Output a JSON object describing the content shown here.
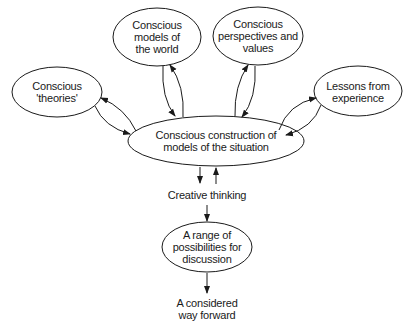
{
  "diagram": {
    "nodes": [
      {
        "id": "theories",
        "lines": [
          "Conscious",
          "'theories'"
        ]
      },
      {
        "id": "models-world",
        "lines": [
          "Conscious",
          "models of",
          "the world"
        ]
      },
      {
        "id": "perspectives",
        "lines": [
          "Conscious",
          "perspectives and",
          "values"
        ]
      },
      {
        "id": "lessons",
        "lines": [
          "Lessons from",
          "experience"
        ]
      },
      {
        "id": "central",
        "lines": [
          "Conscious construction of",
          "models of the situation"
        ]
      },
      {
        "id": "creative",
        "lines": [
          "Creative thinking"
        ]
      },
      {
        "id": "possibilities",
        "lines": [
          "A range of",
          "possibilities for",
          "discussion"
        ]
      },
      {
        "id": "forward",
        "lines": [
          "A considered",
          "way forward"
        ]
      }
    ],
    "edges": [
      {
        "from": "theories",
        "to": "central",
        "bidirectional": true
      },
      {
        "from": "models-world",
        "to": "central",
        "bidirectional": true
      },
      {
        "from": "perspectives",
        "to": "central",
        "bidirectional": true
      },
      {
        "from": "lessons",
        "to": "central",
        "bidirectional": true
      },
      {
        "from": "central",
        "to": "creative",
        "bidirectional": true
      },
      {
        "from": "creative",
        "to": "possibilities",
        "bidirectional": false
      },
      {
        "from": "possibilities",
        "to": "forward",
        "bidirectional": false
      }
    ],
    "colors": {
      "stroke": "#1a1a1a",
      "background": "#ffffff"
    }
  }
}
